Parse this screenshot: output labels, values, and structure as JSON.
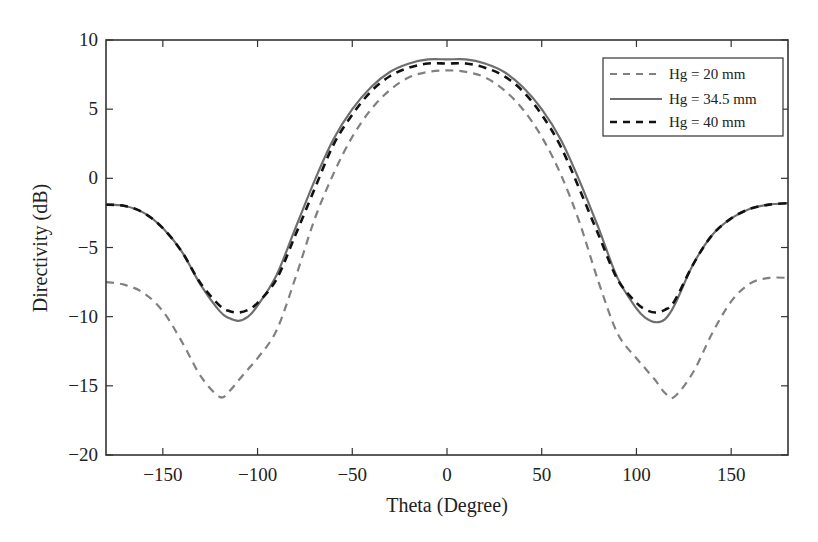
{
  "chart_data": {
    "type": "line",
    "title": "",
    "xlabel": "Theta (Degree)",
    "ylabel": "Directivity (dB)",
    "xlim": [
      -180,
      180
    ],
    "ylim": [
      -20,
      10
    ],
    "xticks": [
      -150,
      -100,
      -50,
      0,
      50,
      100,
      150
    ],
    "yticks": [
      -20,
      -15,
      -10,
      -5,
      0,
      5,
      10
    ],
    "grid": false,
    "legend_position": "upper right",
    "x": [
      -180,
      -170,
      -160,
      -150,
      -140,
      -130,
      -120,
      -115,
      -110,
      -105,
      -100,
      -90,
      -80,
      -70,
      -60,
      -50,
      -40,
      -30,
      -20,
      -10,
      0,
      10,
      20,
      30,
      40,
      50,
      60,
      70,
      80,
      90,
      100,
      105,
      110,
      115,
      120,
      130,
      140,
      150,
      160,
      170,
      180
    ],
    "series": [
      {
        "name": "Hg = 20 mm",
        "style": "dashed",
        "color": "#808080",
        "values": [
          -7.5,
          -7.7,
          -8.3,
          -9.6,
          -11.8,
          -14.3,
          -15.8,
          -15.4,
          -14.6,
          -13.8,
          -13.0,
          -11.0,
          -7.2,
          -3.0,
          0.3,
          3.0,
          5.0,
          6.4,
          7.3,
          7.7,
          7.8,
          7.7,
          7.3,
          6.4,
          5.0,
          3.0,
          0.3,
          -3.2,
          -7.5,
          -11.2,
          -13.0,
          -13.8,
          -14.6,
          -15.5,
          -15.8,
          -14.0,
          -11.2,
          -8.9,
          -7.6,
          -7.2,
          -7.2
        ]
      },
      {
        "name": "Hg = 34.5 mm",
        "style": "solid",
        "color": "#6e6e6e",
        "values": [
          -1.9,
          -2.0,
          -2.5,
          -3.6,
          -5.3,
          -7.7,
          -9.6,
          -10.1,
          -10.3,
          -10.0,
          -9.2,
          -7.0,
          -3.6,
          -0.2,
          2.8,
          5.0,
          6.6,
          7.7,
          8.3,
          8.6,
          8.6,
          8.6,
          8.3,
          7.7,
          6.6,
          5.0,
          2.8,
          -0.2,
          -3.6,
          -7.2,
          -9.4,
          -10.1,
          -10.4,
          -10.2,
          -9.2,
          -6.2,
          -4.1,
          -2.9,
          -2.2,
          -1.9,
          -1.8
        ]
      },
      {
        "name": "Hg = 40 mm",
        "style": "dashed",
        "color": "#111111",
        "values": [
          -1.9,
          -2.0,
          -2.5,
          -3.6,
          -5.3,
          -7.6,
          -9.2,
          -9.6,
          -9.7,
          -9.5,
          -9.0,
          -7.3,
          -4.1,
          -0.8,
          2.4,
          4.6,
          6.3,
          7.4,
          8.0,
          8.3,
          8.3,
          8.3,
          8.0,
          7.4,
          6.3,
          4.6,
          2.3,
          -0.8,
          -4.1,
          -7.3,
          -9.0,
          -9.5,
          -9.7,
          -9.5,
          -8.9,
          -6.2,
          -4.1,
          -2.9,
          -2.2,
          -1.9,
          -1.8
        ]
      }
    ]
  },
  "axes": {
    "xlabel": "Theta (Degree)",
    "ylabel": "Directivity (dB)",
    "xtick_labels": [
      "−150",
      "−100",
      "−50",
      "0",
      "50",
      "100",
      "150"
    ],
    "ytick_labels": [
      "10",
      "5",
      "0",
      "−5",
      "−10",
      "−15",
      "−20"
    ]
  },
  "legend": {
    "entries": [
      "Hg = 20 mm",
      "Hg = 34.5 mm",
      "Hg = 40 mm"
    ]
  }
}
